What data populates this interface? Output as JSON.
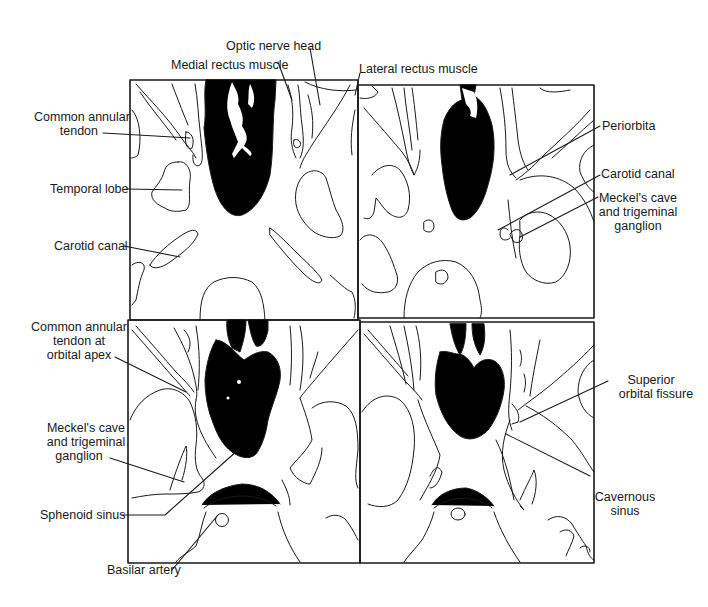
{
  "figure": {
    "colors": {
      "ink": "#1a1a1a",
      "background": "#ffffff",
      "air_spaces": "#000000"
    },
    "panels": [
      {
        "id": "top-left"
      },
      {
        "id": "top-right"
      },
      {
        "id": "bottom-left"
      },
      {
        "id": "bottom-right"
      }
    ],
    "labels": {
      "optic_nerve_head": [
        "Optic nerve head"
      ],
      "medial_rectus": [
        "Medial rectus muscle"
      ],
      "lateral_rectus": [
        "Lateral rectus muscle"
      ],
      "common_annular_tendon": [
        "Common annular",
        "tendon"
      ],
      "temporal_lobe": [
        "Temporal lobe"
      ],
      "carotid_canal_left": [
        "Carotid canal"
      ],
      "periorbita": [
        "Periorbita"
      ],
      "carotid_canal_right": [
        "Carotid canal"
      ],
      "meckels_cave_right": [
        "Meckel's cave",
        "and trigeminal",
        "ganglion"
      ],
      "common_annular_tendon_apex": [
        "Common annular",
        "tendon at",
        "orbital apex"
      ],
      "meckels_cave_left": [
        "Meckel's cave",
        "and trigeminal",
        "ganglion"
      ],
      "sphenoid_sinus": [
        "Sphenoid sinus"
      ],
      "basilar_artery": [
        "Basilar artery"
      ],
      "superior_orbital_fissure": [
        "Superior",
        "orbital fissure"
      ],
      "cavernous_sinus": [
        "Cavernous",
        "sinus"
      ]
    }
  }
}
